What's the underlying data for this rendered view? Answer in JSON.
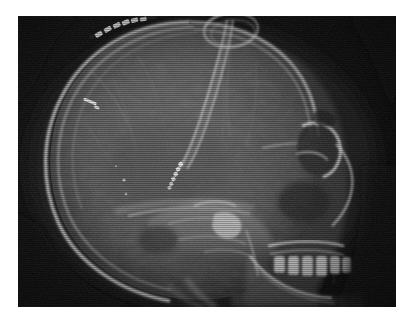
{
  "image": {
    "type": "radiograph",
    "modality": "X-ray",
    "view": "lateral skull",
    "title": "Lateral skull radiograph",
    "caption": "Lateral skull X-ray showing a ventricular shunt catheter and surgical staples",
    "colors": {
      "background": "#ffffff",
      "film_base": "#0a0a0a",
      "soft_tissue": "#4a4a4a",
      "bone": "#b9b9b9",
      "bone_bright": "#e8e8e8",
      "metal": "#f6f6f6",
      "air": "#141414"
    },
    "frame": {
      "x": 18,
      "y": 16,
      "width": 378,
      "height": 291
    },
    "orientation": {
      "face_direction": "right",
      "occiput_direction": "left"
    }
  },
  "anatomy": [
    {
      "id": "calvarium",
      "label": "Calvarium (skull vault)"
    },
    {
      "id": "frontal-bone",
      "label": "Frontal bone"
    },
    {
      "id": "occipital-bone",
      "label": "Occipital bone"
    },
    {
      "id": "orbit",
      "label": "Orbit / orbital roof"
    },
    {
      "id": "sella-turcica",
      "label": "Sella turcica"
    },
    {
      "id": "petrous-ridge",
      "label": "Petrous temporal bone"
    },
    {
      "id": "skull-base",
      "label": "Skull base"
    },
    {
      "id": "maxilla",
      "label": "Maxilla"
    },
    {
      "id": "mandible",
      "label": "Mandible"
    },
    {
      "id": "teeth",
      "label": "Dentition"
    },
    {
      "id": "nasal-region",
      "label": "Nasal region"
    },
    {
      "id": "cervical-spine",
      "label": "Upper cervical spine"
    },
    {
      "id": "scalp-soft-tissue",
      "label": "Scalp soft tissue"
    }
  ],
  "hardware": [
    {
      "id": "ventricular-catheter",
      "label": "Ventricular shunt catheter",
      "description": "Radiopaque twin-stripe tubing descending from vertex into lateral ventricle",
      "marker_beads": 6
    },
    {
      "id": "catheter-loop",
      "label": "Catheter loop at vertex",
      "description": "Coiled loop of tubing external to the skull vault"
    },
    {
      "id": "surgical-staples",
      "label": "Surgical staples",
      "description": "Row of skin staples along the left fronto-parietal incision",
      "count": 6
    },
    {
      "id": "clip-marker",
      "label": "Radiopaque clip marker",
      "description": "Small linear metallic marker in the frontal region"
    }
  ],
  "labels": {
    "image_alt": "Lateral skull radiograph with ventricular catheter and surgical staples"
  }
}
